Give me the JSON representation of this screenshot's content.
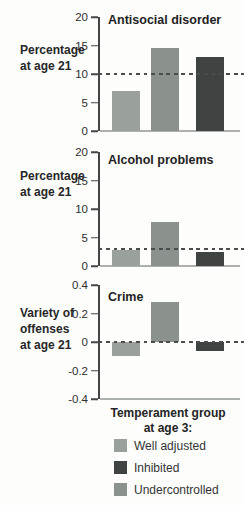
{
  "colors": {
    "well_adjusted": "#9aa09b",
    "inhibited": "#3f4442",
    "undercontrolled": "#8b918c",
    "axis": "#454545",
    "baseline": "#adb1ad",
    "dashed_line": "#4c4c4c"
  },
  "chart_data": [
    {
      "type": "bar",
      "title": "Antisocial disorder",
      "ylabel_lines": [
        "Percentage",
        "at age 21"
      ],
      "ylim": [
        0,
        20
      ],
      "yticks": [
        {
          "value": 20,
          "label": "20"
        },
        {
          "value": 15,
          "label": "15"
        },
        {
          "value": 10,
          "label": "10"
        },
        {
          "value": 5,
          "label": "5"
        },
        {
          "value": 0,
          "label": "0"
        }
      ],
      "reference_line": 10,
      "grid": false,
      "bars": [
        {
          "category": "Well adjusted",
          "value": 7,
          "color_key": "well_adjusted"
        },
        {
          "category": "Undercontrolled",
          "value": 14.5,
          "color_key": "undercontrolled"
        },
        {
          "category": "Inhibited",
          "value": 13,
          "color_key": "inhibited"
        }
      ]
    },
    {
      "type": "bar",
      "title": "Alcohol problems",
      "ylabel_lines": [
        "Percentage",
        "at age 21"
      ],
      "ylim": [
        0,
        20
      ],
      "yticks": [
        {
          "value": 20,
          "label": "20"
        },
        {
          "value": 15,
          "label": "15"
        },
        {
          "value": 10,
          "label": "10"
        },
        {
          "value": 5,
          "label": "5"
        },
        {
          "value": 0,
          "label": "0"
        }
      ],
      "reference_line": 3,
      "grid": false,
      "bars": [
        {
          "category": "Well adjusted",
          "value": 2.8,
          "color_key": "well_adjusted"
        },
        {
          "category": "Undercontrolled",
          "value": 7.7,
          "color_key": "undercontrolled"
        },
        {
          "category": "Inhibited",
          "value": 2.5,
          "color_key": "inhibited"
        }
      ]
    },
    {
      "type": "bar",
      "title": "Crime",
      "ylabel_lines": [
        "Variety of",
        "offenses",
        "at age 21"
      ],
      "ylim": [
        -0.4,
        0.4
      ],
      "yticks": [
        {
          "value": 0.4,
          "label": "0.4"
        },
        {
          "value": 0.2,
          "label": "0.2"
        },
        {
          "value": 0,
          "label": "0"
        },
        {
          "value": -0.2,
          "label": "-0.2"
        },
        {
          "value": -0.4,
          "label": "-0.4"
        }
      ],
      "reference_line": 0,
      "grid": false,
      "bars": [
        {
          "category": "Well adjusted",
          "value": -0.1,
          "color_key": "well_adjusted"
        },
        {
          "category": "Undercontrolled",
          "value": 0.28,
          "color_key": "undercontrolled"
        },
        {
          "category": "Inhibited",
          "value": -0.06,
          "color_key": "inhibited"
        }
      ]
    }
  ],
  "legend": {
    "title_lines": [
      "Temperament group",
      "at age 3:"
    ],
    "items": [
      {
        "label": "Well adjusted",
        "color_key": "well_adjusted"
      },
      {
        "label": "Inhibited",
        "color_key": "inhibited"
      },
      {
        "label": "Undercontrolled",
        "color_key": "undercontrolled"
      }
    ]
  }
}
